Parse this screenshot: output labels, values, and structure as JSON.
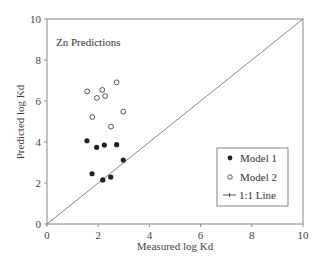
{
  "chart_data": {
    "type": "scatter",
    "title": "Zn Predictions",
    "xlabel": "Measured log Kd",
    "ylabel": "Predicted log Kd",
    "xlim": [
      0,
      10
    ],
    "ylim": [
      0,
      10
    ],
    "xticks": [
      "0",
      "2",
      "4",
      "6",
      "8",
      "10"
    ],
    "yticks": [
      "0",
      "2",
      "4",
      "6",
      "8",
      "10"
    ],
    "grid": false,
    "legend_position": "lower right",
    "series": [
      {
        "name": "Model 1",
        "marker": "filled-circle",
        "x": [
          1.56,
          1.94,
          2.24,
          2.72,
          2.98,
          1.76,
          2.18,
          2.49
        ],
        "y": [
          4.06,
          3.74,
          3.85,
          3.87,
          3.12,
          2.45,
          2.15,
          2.29
        ]
      },
      {
        "name": "Model 2",
        "marker": "open-circle",
        "x": [
          1.57,
          2.72,
          2.16,
          1.95,
          2.27,
          1.77,
          2.98,
          2.5
        ],
        "y": [
          6.47,
          6.91,
          6.54,
          6.15,
          6.24,
          5.22,
          5.48,
          4.75
        ]
      },
      {
        "name": "1:1 Line",
        "marker": "line",
        "x": [
          0,
          10
        ],
        "y": [
          0,
          10
        ]
      }
    ]
  },
  "legend": {
    "items": [
      {
        "label": "Model 1"
      },
      {
        "label": "Model 2"
      },
      {
        "label": "1:1 Line"
      }
    ]
  }
}
